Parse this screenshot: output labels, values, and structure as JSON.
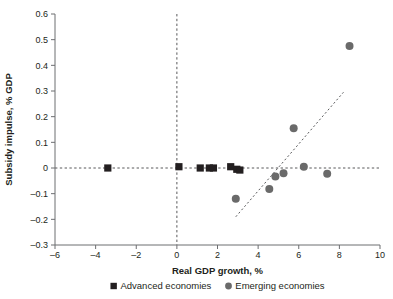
{
  "chart_data": {
    "type": "scatter",
    "title": "",
    "xlabel": "Real GDP growth, %",
    "ylabel": "Subsidy impulse, % GDP",
    "xlim": [
      -6,
      10
    ],
    "ylim": [
      -0.3,
      0.6
    ],
    "xticks": [
      -6,
      -4,
      -2,
      0,
      2,
      4,
      6,
      8,
      10
    ],
    "yticks": [
      -0.3,
      -0.2,
      -0.1,
      0,
      0.1,
      0.2,
      0.3,
      0.4,
      0.5,
      0.6
    ],
    "xtick_labels": [
      "–6",
      "–4",
      "–2",
      "0",
      "2",
      "4",
      "6",
      "8",
      "10"
    ],
    "ytick_labels": [
      "–0.3",
      "–0.2",
      "–0.1",
      "0",
      "0.1",
      "0.2",
      "0.3",
      "0.4",
      "0.5",
      "0.6"
    ],
    "grid": false,
    "legend_position": "bottom",
    "reference_lines": [
      {
        "name": "zero-horizontal",
        "orientation": "horizontal",
        "value": 0,
        "style": "dashed"
      },
      {
        "name": "zero-vertical",
        "orientation": "vertical",
        "value": 0,
        "style": "dashed"
      }
    ],
    "trendline": {
      "name": "emerging-trendline",
      "style": "dashed",
      "x_start": 2.9,
      "y_start": -0.19,
      "x_end": 8.2,
      "y_end": 0.295
    },
    "series": [
      {
        "name": "Advanced economies",
        "marker": "square",
        "color": "#231f20",
        "points": [
          {
            "x": -3.4,
            "y": 0.0
          },
          {
            "x": 0.1,
            "y": 0.005
          },
          {
            "x": 1.15,
            "y": 0.0
          },
          {
            "x": 1.6,
            "y": 0.0
          },
          {
            "x": 1.8,
            "y": 0.0
          },
          {
            "x": 2.65,
            "y": 0.005
          },
          {
            "x": 2.95,
            "y": -0.005
          },
          {
            "x": 3.1,
            "y": -0.008
          }
        ]
      },
      {
        "name": "Emerging economies",
        "marker": "circle",
        "color": "#6a6a6a",
        "points": [
          {
            "x": 2.9,
            "y": -0.12
          },
          {
            "x": 4.55,
            "y": -0.082
          },
          {
            "x": 4.85,
            "y": -0.033
          },
          {
            "x": 5.25,
            "y": -0.02
          },
          {
            "x": 5.75,
            "y": 0.155
          },
          {
            "x": 6.25,
            "y": 0.005
          },
          {
            "x": 7.4,
            "y": -0.022
          },
          {
            "x": 8.5,
            "y": 0.475
          }
        ]
      }
    ]
  },
  "legend": {
    "items": [
      {
        "label": "Advanced economies",
        "marker": "square",
        "color": "#231f20"
      },
      {
        "label": "Emerging economies",
        "marker": "circle",
        "color": "#6a6a6a"
      }
    ]
  }
}
